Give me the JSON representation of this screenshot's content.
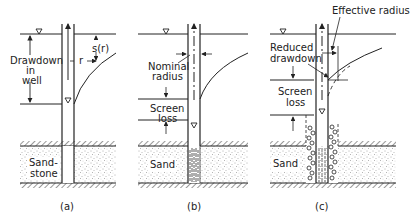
{
  "figure": {
    "panels": [
      {
        "id": "a",
        "caption": "(a)",
        "labels": {
          "drawdown_line1": "Drawdown",
          "drawdown_line2": "in",
          "drawdown_line3": "well",
          "s_of_r": "s(r)",
          "r": "r",
          "formation_line1": "Sand-",
          "formation_line2": "stone"
        }
      },
      {
        "id": "b",
        "caption": "(b)",
        "labels": {
          "nominal_line1": "Nominal",
          "nominal_line2": "radius",
          "screen_line1": "Screen",
          "screen_line2": "loss",
          "formation": "Sand"
        }
      },
      {
        "id": "c",
        "caption": "(c)",
        "labels": {
          "effective_radius": "Effective radius",
          "reduced_line1": "Reduced",
          "reduced_line2": "drawdown",
          "screen_line1": "Screen",
          "screen_line2": "loss",
          "formation": "Sand"
        }
      }
    ],
    "colors": {
      "ink": "#222222",
      "background": "#ffffff",
      "stipple": "#555555"
    }
  }
}
